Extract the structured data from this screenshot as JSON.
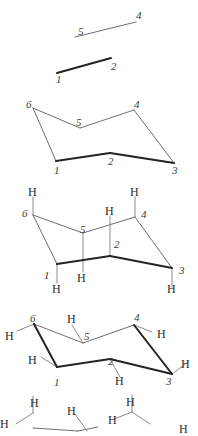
{
  "figure": {
    "colors": {
      "thin_line": "#6e6e6e",
      "bold_line": "#242424",
      "h_bond": "#8a8a8a",
      "label": "#2b2b2b",
      "background": "#ffffff"
    },
    "panels": [
      {
        "id": "panel-1",
        "name": "two-parallel-lines",
        "caption": "",
        "carbon_labels": [
          {
            "text": "5",
            "x": 78,
            "y": 26
          },
          {
            "text": "4",
            "x": 136,
            "y": 10
          },
          {
            "text": "1",
            "x": 56,
            "y": 74
          },
          {
            "text": "2",
            "x": 111,
            "y": 61
          }
        ],
        "hydrogen_labels": [],
        "bonds_thin": [
          [
            75,
            37,
            136,
            22
          ]
        ],
        "bonds_bold": [
          [
            57,
            73,
            111,
            58
          ]
        ]
      },
      {
        "id": "panel-2",
        "name": "chair-skeleton",
        "caption": "",
        "carbon_labels": [
          {
            "text": "6",
            "x": 26,
            "y": 99
          },
          {
            "text": "5",
            "x": 76,
            "y": 117
          },
          {
            "text": "4",
            "x": 134,
            "y": 99
          },
          {
            "text": "3",
            "x": 172,
            "y": 165
          },
          {
            "text": "2",
            "x": 108,
            "y": 156
          },
          {
            "text": "1",
            "x": 54,
            "y": 165
          }
        ],
        "hydrogen_labels": [],
        "bonds_thin": [
          [
            33,
            108,
            80,
            128
          ],
          [
            80,
            128,
            134,
            110
          ],
          [
            134,
            110,
            174,
            163
          ],
          [
            33,
            108,
            56,
            161
          ]
        ],
        "bonds_bold": [
          [
            56,
            161,
            110,
            153
          ],
          [
            110,
            153,
            174,
            163
          ]
        ]
      },
      {
        "id": "panel-3",
        "name": "chair-with-axial-hydrogens",
        "caption": "",
        "carbon_labels": [
          {
            "text": "6",
            "x": 22,
            "y": 208
          },
          {
            "text": "5",
            "x": 80,
            "y": 224
          },
          {
            "text": "4",
            "x": 141,
            "y": 209
          },
          {
            "text": "3",
            "x": 179,
            "y": 265
          },
          {
            "text": "2",
            "x": 114,
            "y": 239
          },
          {
            "text": "1",
            "x": 44,
            "y": 270
          }
        ],
        "hydrogen_labels": [
          {
            "text": "H",
            "x": 28,
            "y": 186
          },
          {
            "text": "H",
            "x": 130,
            "y": 186
          },
          {
            "text": "H",
            "x": 105,
            "y": 205
          },
          {
            "text": "H",
            "x": 77,
            "y": 272
          },
          {
            "text": "H",
            "x": 52,
            "y": 283
          },
          {
            "text": "H",
            "x": 167,
            "y": 283
          }
        ],
        "bonds_thin": [
          [
            33,
            215,
            83,
            233
          ],
          [
            83,
            233,
            135,
            217
          ],
          [
            135,
            217,
            172,
            268
          ],
          [
            33,
            215,
            57,
            264
          ]
        ],
        "bonds_bold": [
          [
            57,
            264,
            110,
            256
          ],
          [
            110,
            256,
            172,
            268
          ]
        ],
        "axial_bonds_up": [
          [
            33,
            215,
            33,
            197
          ],
          [
            135,
            217,
            135,
            197
          ],
          [
            110,
            256,
            110,
            216
          ]
        ],
        "axial_bonds_down": [
          [
            83,
            233,
            83,
            272
          ],
          [
            57,
            264,
            57,
            283
          ],
          [
            172,
            268,
            172,
            287
          ]
        ]
      },
      {
        "id": "panel-4",
        "name": "chair-with-equatorial-hydrogens",
        "caption": "",
        "carbon_labels": [
          {
            "text": "6",
            "x": 30,
            "y": 313
          },
          {
            "text": "5",
            "x": 84,
            "y": 331
          },
          {
            "text": "4",
            "x": 134,
            "y": 312
          },
          {
            "text": "3",
            "x": 166,
            "y": 376
          },
          {
            "text": "2",
            "x": 108,
            "y": 356
          },
          {
            "text": "1",
            "x": 54,
            "y": 377
          }
        ],
        "hydrogen_labels": [
          {
            "text": "H",
            "x": 5,
            "y": 330
          },
          {
            "text": "H",
            "x": 67,
            "y": 313
          },
          {
            "text": "H",
            "x": 157,
            "y": 328
          },
          {
            "text": "H",
            "x": 28,
            "y": 354
          },
          {
            "text": "H",
            "x": 115,
            "y": 375
          },
          {
            "text": "H",
            "x": 181,
            "y": 358
          }
        ],
        "bonds_thin": [
          [
            34,
            324,
            83,
            343
          ],
          [
            83,
            343,
            134,
            325
          ],
          [
            134,
            325,
            172,
            374
          ]
        ],
        "bonds_bold": [
          [
            34,
            324,
            57,
            367
          ],
          [
            57,
            367,
            110,
            359
          ],
          [
            110,
            359,
            172,
            374
          ],
          [
            134,
            325,
            172,
            374
          ]
        ],
        "equatorial_bonds": [
          [
            34,
            324,
            17,
            331
          ],
          [
            83,
            343,
            72,
            325
          ],
          [
            134,
            325,
            152,
            332
          ],
          [
            57,
            367,
            41,
            357
          ],
          [
            110,
            359,
            120,
            377
          ],
          [
            172,
            374,
            188,
            362
          ]
        ]
      },
      {
        "id": "panel-5",
        "name": "chair-with-all-hydrogens-cropped",
        "caption": "",
        "carbon_labels": [],
        "hydrogen_labels": [
          {
            "text": "H",
            "x": 30,
            "y": 397
          },
          {
            "text": "H",
            "x": 0,
            "y": 418
          },
          {
            "text": "H",
            "x": 67,
            "y": 405
          },
          {
            "text": "H",
            "x": 126,
            "y": 396
          },
          {
            "text": "H",
            "x": 108,
            "y": 414
          },
          {
            "text": "H",
            "x": 179,
            "y": 423
          }
        ],
        "bonds_thin": [
          [
            33,
            428,
            78,
            431
          ],
          [
            78,
            431,
            98,
            427
          ]
        ],
        "bonds_bold": [],
        "axial_bonds_up": [
          [
            33,
            413,
            33,
            396
          ],
          [
            132,
            412,
            132,
            395
          ]
        ],
        "equatorial_bonds": [
          [
            33,
            413,
            16,
            424
          ],
          [
            75,
            414,
            87,
            431
          ],
          [
            132,
            412,
            114,
            419
          ],
          [
            132,
            412,
            150,
            424
          ]
        ]
      }
    ]
  }
}
